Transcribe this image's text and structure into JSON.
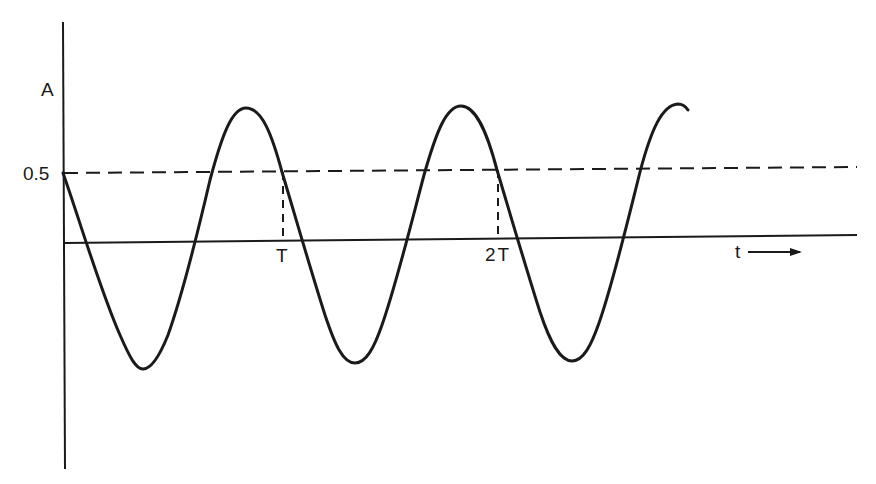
{
  "diagram": {
    "type": "waveform",
    "y_axis_label": "A",
    "y_tick_label": "0.5",
    "x_axis_label": "t",
    "x_axis_arrow": "right-arrow",
    "period_markers": [
      "T",
      "2T"
    ],
    "reference_line": {
      "value": "0.5",
      "style": "dashed"
    },
    "colors": {
      "ink": "#1a1a1a",
      "background": "#ffffff"
    }
  }
}
